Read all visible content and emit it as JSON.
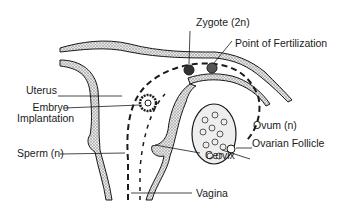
{
  "diagram": {
    "labels": {
      "zygote": "Zygote (2n)",
      "fertilization": "Point of Fertilization",
      "uterus": "Uterus",
      "embryo_line1": "Embryo",
      "embryo_line2": "Implantation",
      "ovum": "Ovum (n)",
      "follicle": "Ovarian Follicle",
      "sperm": "Sperm (n)",
      "cervix": "Cervix",
      "vagina": "Vagina"
    },
    "colors": {
      "ink": "#1a1a1a",
      "tissue_fill": "#c8c8c8",
      "background": "#ffffff"
    }
  }
}
